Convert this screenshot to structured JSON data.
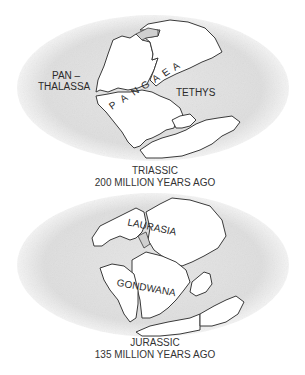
{
  "maps": [
    {
      "period": "TRIASSIC",
      "age": "200 MILLION YEARS AGO",
      "labels": {
        "ocean_line1": "PAN –",
        "ocean_line2": "THALASSA",
        "supercontinent": "PANGAEA",
        "sea": "TETHYS"
      },
      "letters": [
        "P",
        "A",
        "N",
        "G",
        "A",
        "E",
        "A"
      ]
    },
    {
      "period": "JURASSIC",
      "age": "135 MILLION YEARS AGO",
      "labels": {
        "north": "LAURASIA",
        "south": "GONDWANA"
      }
    }
  ],
  "colors": {
    "ocean": "#e3e3e3",
    "land": "#ffffff",
    "outline": "#3a3a3a",
    "text": "#2a2a2a"
  }
}
